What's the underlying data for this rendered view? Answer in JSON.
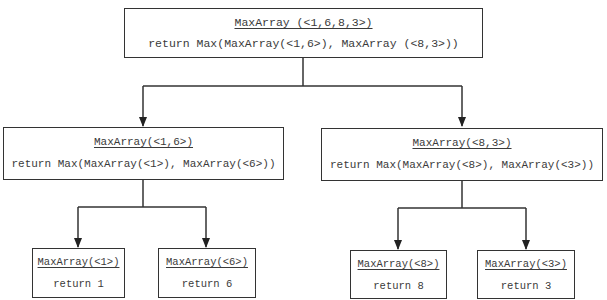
{
  "diagram": {
    "type": "recursion-tree",
    "line_color": "#333333",
    "text_color": "#3a3a3a",
    "nodes": {
      "root": {
        "title": "MaxArray (<1,6,8,3>)",
        "body": "return Max(MaxArray(<1,6>), MaxArray (<8,3>))"
      },
      "left": {
        "title": "MaxArray(<1,6>)",
        "body": "return Max(MaxArray(<1>), MaxArray(<6>))"
      },
      "right": {
        "title": "MaxArray(<8,3>)",
        "body": "return Max(MaxArray(<8>), MaxArray(<3>))"
      },
      "leaf1": {
        "title": "MaxArray(<1>)",
        "body": "return 1"
      },
      "leaf6": {
        "title": "MaxArray(<6>)",
        "body": "return 6"
      },
      "leaf8": {
        "title": "MaxArray(<8>)",
        "body": "return 8"
      },
      "leaf3": {
        "title": "MaxArray(<3>)",
        "body": "return 3"
      }
    },
    "edges": [
      [
        "root",
        "left"
      ],
      [
        "root",
        "right"
      ],
      [
        "left",
        "leaf1"
      ],
      [
        "left",
        "leaf6"
      ],
      [
        "right",
        "leaf8"
      ],
      [
        "right",
        "leaf3"
      ]
    ]
  }
}
